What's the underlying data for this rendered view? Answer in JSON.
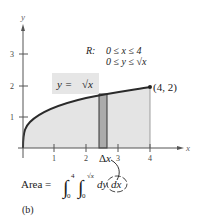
{
  "figure": {
    "caption": "(b)",
    "axes": {
      "x_label": "x",
      "y_label": "y",
      "x_ticks": [
        "1",
        "2",
        "3",
        "4"
      ],
      "y_ticks": [
        "1",
        "2",
        "3"
      ]
    },
    "curve_label": {
      "lhs": "y =",
      "rhs": "√x"
    },
    "endpoint_label": "(4, 2)",
    "region": {
      "prefix": "R:",
      "line1": "0 ≤ x ≤ 4",
      "line2_a": "0 ≤ y ≤ ",
      "line2_b": "√x"
    },
    "strip_label": "Δx",
    "area_formula": {
      "lhs": "Area =",
      "outer_upper": "4",
      "outer_lower": "0",
      "inner_upper": "√x",
      "inner_lower": "0",
      "integrand": "dy",
      "differential": "dx"
    },
    "colors": {
      "region_fill": "#e4e4e4",
      "strip_fill": "#ababab",
      "curve": "#2a2a2a",
      "axis": "#555555",
      "label_box": "#e6e6e6"
    }
  }
}
